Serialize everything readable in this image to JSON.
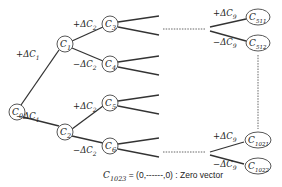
{
  "diagram": {
    "type": "binary-tree",
    "colors": {
      "line": "#333333",
      "text": "#222222",
      "background": "#ffffff"
    },
    "nodes": [
      {
        "id": "C0",
        "base": "C",
        "sub": "0",
        "x": 17,
        "y": 112
      },
      {
        "id": "C1",
        "base": "C",
        "sub": "1",
        "x": 65,
        "y": 44
      },
      {
        "id": "C2",
        "base": "C",
        "sub": "2",
        "x": 65,
        "y": 132
      },
      {
        "id": "C3",
        "base": "C",
        "sub": "3",
        "x": 110,
        "y": 24
      },
      {
        "id": "C4",
        "base": "C",
        "sub": "4",
        "x": 110,
        "y": 64
      },
      {
        "id": "C5",
        "base": "C",
        "sub": "5",
        "x": 110,
        "y": 103
      },
      {
        "id": "C6",
        "base": "C",
        "sub": "6",
        "x": 110,
        "y": 146
      },
      {
        "id": "C511",
        "base": "C",
        "sub": "511",
        "x": 258,
        "y": 17
      },
      {
        "id": "C512",
        "base": "C",
        "sub": "512",
        "x": 258,
        "y": 43
      },
      {
        "id": "C1021",
        "base": "C",
        "sub": "1021",
        "x": 258,
        "y": 140
      },
      {
        "id": "C1022",
        "base": "C",
        "sub": "1022",
        "x": 258,
        "y": 166
      }
    ],
    "edge_labels": [
      {
        "sign": "+",
        "base": "ΔC",
        "sub": "1",
        "x": 16,
        "y": 57
      },
      {
        "sign": "−",
        "base": "ΔC",
        "sub": "1",
        "x": 16,
        "y": 119
      },
      {
        "sign": "+",
        "base": "ΔC",
        "sub": "2",
        "x": 73,
        "y": 27
      },
      {
        "sign": "−",
        "base": "ΔC",
        "sub": "2",
        "x": 73,
        "y": 67
      },
      {
        "sign": "+",
        "base": "ΔC",
        "sub": "2",
        "x": 73,
        "y": 109
      },
      {
        "sign": "−",
        "base": "ΔC",
        "sub": "2",
        "x": 73,
        "y": 153
      },
      {
        "sign": "+",
        "base": "ΔC",
        "sub": "9",
        "x": 213,
        "y": 16
      },
      {
        "sign": "−",
        "base": "ΔC",
        "sub": "9",
        "x": 213,
        "y": 45
      },
      {
        "sign": "+",
        "base": "ΔC",
        "sub": "9",
        "x": 213,
        "y": 139
      },
      {
        "sign": "−",
        "base": "ΔC",
        "sub": "9",
        "x": 213,
        "y": 167
      }
    ],
    "caption": {
      "base": "C",
      "sub": "1023",
      "text": " = (0,------,0) : Zero vector"
    }
  }
}
